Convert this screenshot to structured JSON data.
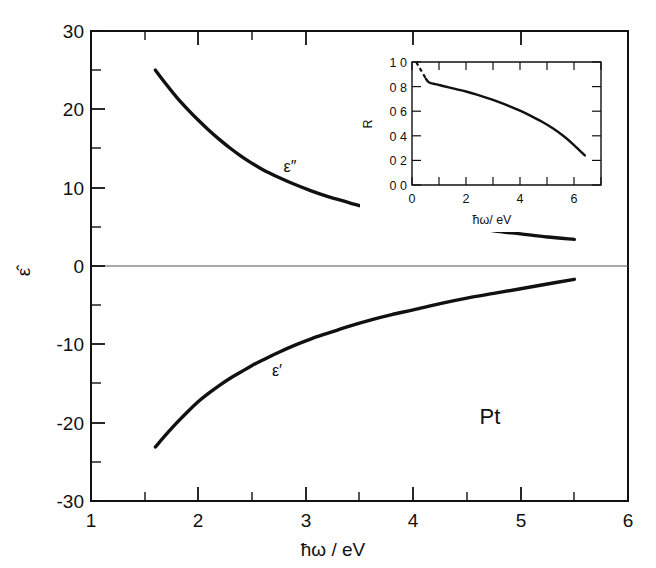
{
  "figure": {
    "sample_label": "Pt",
    "background_color": "#ffffff",
    "ink_color": "#111111"
  },
  "chart_data": [
    {
      "id": "main",
      "type": "line",
      "title": "",
      "xlabel": "ħω / eV",
      "ylabel": "ε̂",
      "xlim": [
        1,
        6
      ],
      "ylim": [
        -30,
        30
      ],
      "xticks": [
        1,
        2,
        3,
        4,
        5,
        6
      ],
      "xtick_labels": [
        "1",
        "2",
        "3",
        "4",
        "5",
        "6"
      ],
      "xminor_ticks": [
        1.5,
        2.5,
        3.5,
        4.5,
        5.5
      ],
      "yticks": [
        -30,
        -20,
        -10,
        0,
        10,
        20,
        30
      ],
      "ytick_labels": [
        "-30",
        "-20",
        "-10",
        "0",
        "10",
        "20",
        "30"
      ],
      "yminor_ticks": [
        -25,
        -15,
        -5,
        5,
        15,
        25
      ],
      "grid": false,
      "legend": "none",
      "annotations": [
        {
          "text": "ε″",
          "x": 2.85,
          "y": 12.8
        },
        {
          "text": "ε′",
          "x": 2.72,
          "y": -12.4
        },
        {
          "text": "Pt",
          "x": 4.72,
          "y": -19.2
        }
      ],
      "series": [
        {
          "name": "ε″",
          "x": [
            1.6,
            1.7,
            1.8,
            1.9,
            2.0,
            2.1,
            2.2,
            2.3,
            2.4,
            2.5,
            2.6,
            2.75,
            2.9,
            3.05,
            3.2,
            3.4,
            3.6,
            3.8,
            4.0,
            4.25,
            4.5,
            4.75,
            5.0,
            5.25,
            5.5
          ],
          "y": [
            25.0,
            23.2,
            21.5,
            20.0,
            18.6,
            17.3,
            16.1,
            15.0,
            14.0,
            13.1,
            12.3,
            11.3,
            10.4,
            9.6,
            8.9,
            8.1,
            7.3,
            6.7,
            6.1,
            5.5,
            5.0,
            4.5,
            4.1,
            3.7,
            3.4
          ]
        },
        {
          "name": "ε′",
          "x": [
            1.6,
            1.7,
            1.8,
            1.9,
            2.0,
            2.1,
            2.2,
            2.3,
            2.4,
            2.5,
            2.6,
            2.75,
            2.9,
            3.05,
            3.2,
            3.4,
            3.6,
            3.8,
            4.0,
            4.25,
            4.5,
            4.75,
            5.0,
            5.25,
            5.5
          ],
          "y": [
            -23.1,
            -21.5,
            -20.0,
            -18.6,
            -17.3,
            -16.2,
            -15.2,
            -14.3,
            -13.5,
            -12.7,
            -12.0,
            -11.0,
            -10.1,
            -9.3,
            -8.6,
            -7.7,
            -6.9,
            -6.2,
            -5.6,
            -4.8,
            -4.1,
            -3.5,
            -2.9,
            -2.3,
            -1.7
          ]
        }
      ]
    },
    {
      "id": "inset",
      "type": "line",
      "title": "",
      "xlabel": "ħω/ eV",
      "ylabel": "R",
      "xlim": [
        0,
        7
      ],
      "ylim": [
        0.0,
        1.0
      ],
      "xticks": [
        0,
        2,
        4,
        6
      ],
      "xtick_labels": [
        "0",
        "2",
        "4",
        "6"
      ],
      "xminor_ticks": [
        1,
        3,
        5,
        7
      ],
      "yticks": [
        0.0,
        0.2,
        0.4,
        0.6,
        0.8,
        1.0
      ],
      "ytick_labels": [
        "0 0",
        "0 2",
        "0 4",
        "0 6",
        "0 8",
        "1 0"
      ],
      "yminor_ticks": [
        0.1,
        0.3,
        0.5,
        0.7,
        0.9
      ],
      "grid": false,
      "legend": "none",
      "series": [
        {
          "name": "R",
          "style": "dashed",
          "x": [
            0.16,
            0.22,
            0.3,
            0.38,
            0.46,
            0.52
          ],
          "y": [
            1.0,
            0.975,
            0.945,
            0.915,
            0.885,
            0.862
          ]
        },
        {
          "name": "R",
          "style": "solid",
          "x": [
            0.52,
            0.58,
            0.64,
            0.7,
            0.8,
            0.95,
            1.15,
            1.4,
            1.7,
            2.0,
            2.4,
            2.8,
            3.2,
            3.6,
            4.0,
            4.4,
            4.8,
            5.2,
            5.6,
            6.0,
            6.4
          ],
          "y": [
            0.862,
            0.843,
            0.833,
            0.828,
            0.823,
            0.816,
            0.805,
            0.792,
            0.776,
            0.76,
            0.735,
            0.707,
            0.676,
            0.642,
            0.604,
            0.562,
            0.516,
            0.463,
            0.4,
            0.325,
            0.24
          ]
        }
      ]
    }
  ]
}
